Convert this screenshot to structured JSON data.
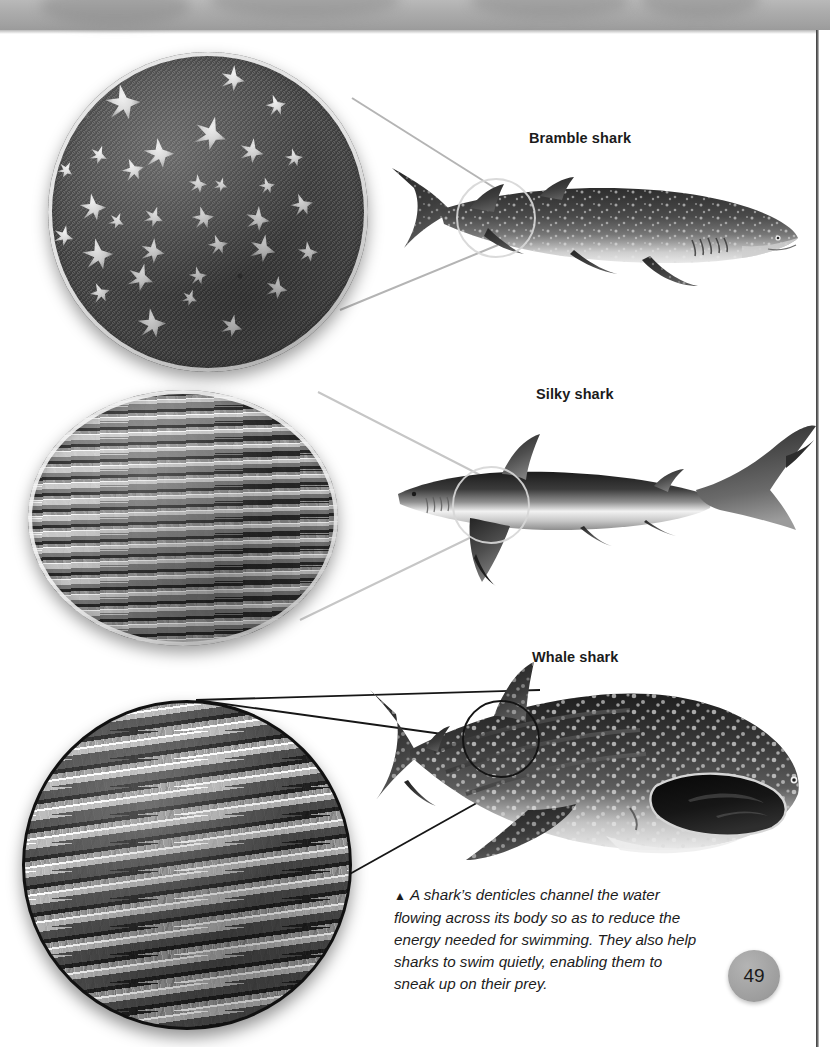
{
  "page": {
    "number": "49",
    "background_color": "#ffffff",
    "edge_strip_color": "#a8a8a8"
  },
  "panels": [
    {
      "id": "bramble",
      "label": "Bramble shark",
      "inset_caption": "magnified skin denticles of a bramble shark",
      "leader_color": "#b9b9b9",
      "texture": "scattered thorn-shaped denticles on dark granular skin"
    },
    {
      "id": "silky",
      "label": "Silky shark",
      "inset_caption": "magnified skin denticles of a silky shark",
      "leader_color": "#c9c9c9",
      "texture": "overlapping flat ridged plate denticles"
    },
    {
      "id": "whale",
      "label": "Whale shark",
      "inset_caption": "magnified skin denticles of a whale shark",
      "leader_color": "#141414",
      "texture": "ribbed comb-like denticles in rows"
    }
  ],
  "caption": {
    "marker": "▲",
    "text": "A shark’s denticles channel the water flowing across its body so as to reduce the energy needed for swimming. They also help sharks to swim quietly, enabling them to sneak up on their prey."
  }
}
